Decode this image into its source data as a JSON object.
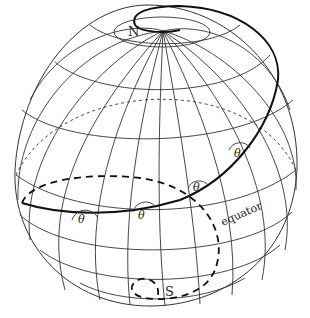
{
  "diagram": {
    "type": "globe-loxodrome",
    "labels": {
      "north_pole": "N",
      "south_pole": "S",
      "equator": "equator",
      "angle": "θ"
    },
    "angle_markers": [
      {
        "label": "θ",
        "x": 238,
        "y": 153
      },
      {
        "label": "θ",
        "x": 199,
        "y": 187
      },
      {
        "label": "θ",
        "x": 143,
        "y": 215
      },
      {
        "label": "θ",
        "x": 82,
        "y": 219
      }
    ],
    "colors": {
      "grid": "#333333",
      "loxodrome": "#111111",
      "background": "#ffffff"
    }
  }
}
